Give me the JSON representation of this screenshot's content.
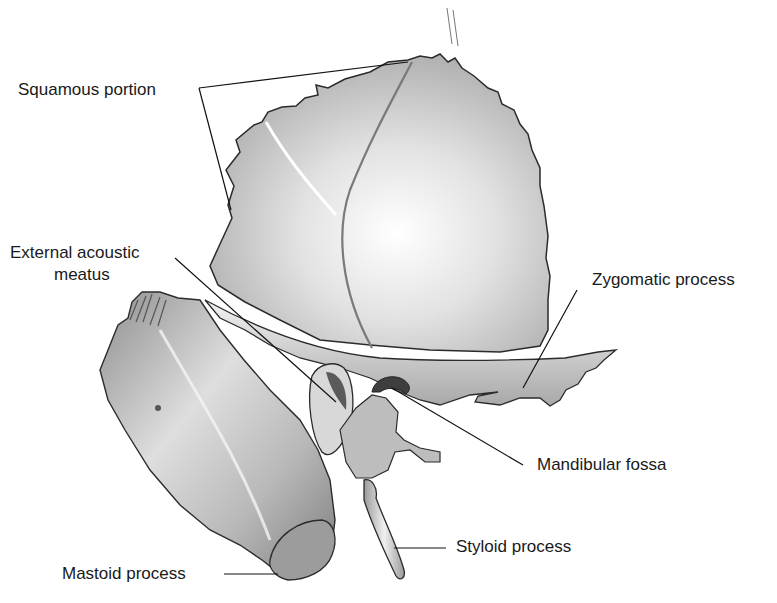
{
  "figure": {
    "title_clipped": "",
    "colors": {
      "background": "#ffffff",
      "bone_light": "#ececec",
      "bone_mid": "#bdbdbd",
      "bone_dark": "#7a7a7a",
      "outline": "#2b2b2b",
      "leader": "#111111",
      "text": "#1a1a1a"
    }
  },
  "labels": [
    {
      "id": "squamous",
      "text": "Squamous portion",
      "x": 18,
      "y": 80
    },
    {
      "id": "eam_line1",
      "text": "External acoustic",
      "x": 10,
      "y": 243
    },
    {
      "id": "eam_line2",
      "text": "meatus",
      "x": 54,
      "y": 265
    },
    {
      "id": "zygomatic",
      "text": "Zygomatic process",
      "x": 592,
      "y": 270
    },
    {
      "id": "mandibular",
      "text": "Mandibular fossa",
      "x": 537,
      "y": 455
    },
    {
      "id": "styloid",
      "text": "Styloid process",
      "x": 456,
      "y": 537
    },
    {
      "id": "mastoid",
      "text": "Mastoid process",
      "x": 62,
      "y": 564
    }
  ],
  "leaders": [
    {
      "id": "squamous-top",
      "points": "199,88 408,62"
    },
    {
      "id": "squamous-bottom",
      "points": "199,88 231,210"
    },
    {
      "id": "eam",
      "points": "175,258 318,352"
    },
    {
      "id": "zygomatic",
      "points": "577,290 523,388"
    },
    {
      "id": "mandibular",
      "points": "523,465 380,378"
    },
    {
      "id": "styloid",
      "points": "446,548 394,548"
    },
    {
      "id": "mastoid",
      "points": "224,574 278,574"
    }
  ]
}
